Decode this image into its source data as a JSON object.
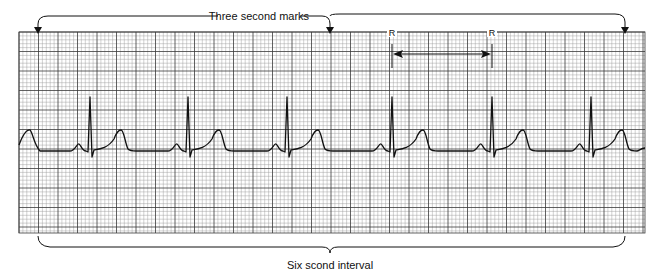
{
  "diagram": {
    "title_top": "Three second marks",
    "title_bottom": "Six scond interval",
    "r_label_1": "R",
    "r_label_2": "R",
    "colors": {
      "grid_minor": "#9a9a9a",
      "grid_major": "#3a3a3a",
      "trace": "#111111",
      "background": "#ffffff"
    },
    "grid": {
      "x0": 19,
      "y0": 32,
      "x1": 645,
      "y1": 233,
      "minor_px": 3.9,
      "major_px": 19.5
    },
    "three_second_marks_x": [
      38,
      330,
      625
    ],
    "rr_interval": {
      "r1_x": 392,
      "r2_x": 492,
      "arrow_y": 54
    },
    "ecg": {
      "r_peaks_x": [
        90,
        188,
        287,
        392,
        492,
        591
      ],
      "baseline_y": 151,
      "r_top_y": 97,
      "t_peak_y": 130,
      "p_peak_y": 145
    }
  }
}
